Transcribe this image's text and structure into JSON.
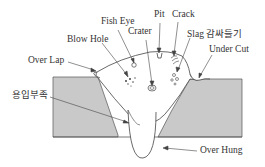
{
  "diagram": {
    "colors": {
      "base_metal": "#c9c9c9",
      "weld_bead": "#ffffff",
      "line": "#444444",
      "text": "#333333"
    },
    "labels": {
      "fish_eye": "Fish Eye",
      "pit": "Pit",
      "crack": "Crack",
      "blow_hole": "Blow Hole",
      "crater": "Crater",
      "slag": "Slag 감싸들기",
      "under_cut": "Under Cut",
      "over_lap": "Over Lap",
      "incomplete_fusion": "용입부족",
      "over_hung": "Over Hung"
    }
  }
}
